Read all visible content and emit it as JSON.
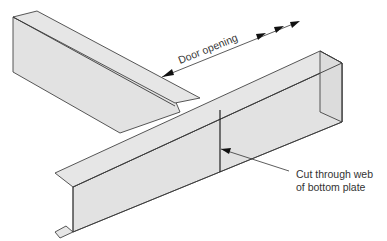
{
  "diagram": {
    "labels": {
      "door_opening": "Door opening",
      "cut_line1": "Cut through web",
      "cut_line2": "of bottom plate"
    },
    "colors": {
      "metal_fill": "#e2e2e2",
      "outline": "#444444",
      "text": "#333333",
      "background": "#ffffff"
    }
  }
}
